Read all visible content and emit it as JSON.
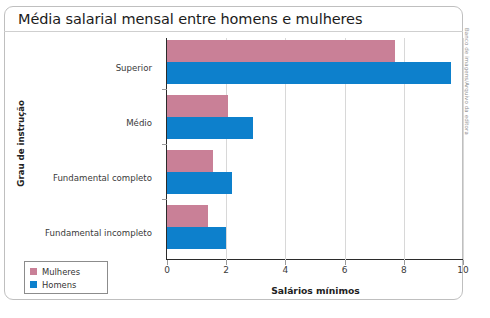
{
  "figure": {
    "title": "Média salarial mensal entre homens e mulheres",
    "credit": "Banco de imagens/Arquivo da editora"
  },
  "legend": {
    "items": [
      {
        "label": "Mulheres",
        "color": "#c98097",
        "swatch_name": "legend-swatch-mulheres"
      },
      {
        "label": "Homens",
        "color": "#0d80cc",
        "swatch_name": "legend-swatch-homens"
      }
    ]
  },
  "chart_data": {
    "type": "bar",
    "orientation": "horizontal",
    "title": "Média salarial mensal entre homens e mulheres",
    "xlabel": "Salários mínimos",
    "ylabel": "Grau de instrução",
    "categories": [
      "Superior",
      "Médio",
      "Fundamental completo",
      "Fundamental incompleto"
    ],
    "series": [
      {
        "name": "Mulheres",
        "color": "#c98097",
        "values": [
          7.7,
          2.05,
          1.55,
          1.4
        ]
      },
      {
        "name": "Homens",
        "color": "#0d80cc",
        "values": [
          9.6,
          2.9,
          2.2,
          2.0
        ]
      }
    ],
    "xlim": [
      0,
      10
    ],
    "xticks": [
      "0",
      "2",
      "4",
      "6",
      "8",
      "10"
    ],
    "xtick_values": [
      0,
      2,
      4,
      6,
      8,
      10
    ],
    "grid": "vertical-light",
    "legend_position": "below-left-outside"
  }
}
